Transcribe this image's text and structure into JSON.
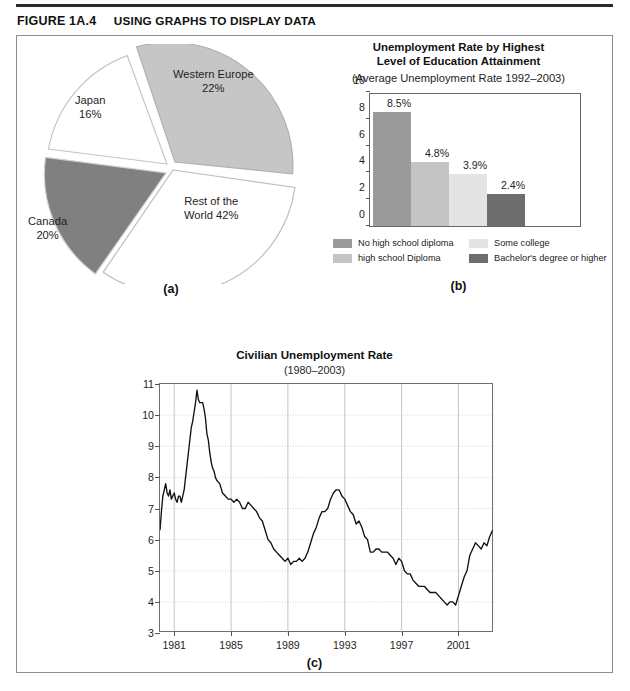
{
  "figure": {
    "number": "FIGURE 1A.4",
    "title": "USING GRAPHS TO DISPLAY DATA"
  },
  "panel_a": {
    "sublabel": "(a)",
    "labels": {
      "western_europe": "Western Europe\n22%",
      "japan": "Japan\n16%",
      "canada": "Canada\n20%",
      "rest": "Rest of the\nWorld 42%"
    },
    "chart_data": {
      "type": "pie",
      "title": "",
      "categories": [
        "Western Europe",
        "Rest of the World",
        "Canada",
        "Japan"
      ],
      "values": [
        22,
        42,
        20,
        16
      ],
      "units": "percent",
      "colors": [
        "#c6c6c6",
        "#ffffff",
        "#808080",
        "#ffffff"
      ],
      "exploded": true,
      "legend": "labels-outside"
    }
  },
  "panel_b": {
    "title": "Unemployment Rate by Highest\nLevel of Education Attainment",
    "subtitle": "(Average Unemployment Rate 1992–2003)",
    "sublabel": "(b)",
    "legend": [
      {
        "label": "No high school diploma",
        "color": "#9a9a9a"
      },
      {
        "label": "Some college",
        "color": "#e4e4e4"
      },
      {
        "label": "high school Diploma",
        "color": "#c4c4c4"
      },
      {
        "label": "Bachelor's degree or higher",
        "color": "#6e6e6e"
      }
    ],
    "chart_data": {
      "type": "bar",
      "title": "Unemployment Rate by Highest Level of Education Attainment",
      "subtitle": "(Average Unemployment Rate 1992–2003)",
      "xlabel": "",
      "ylabel": "",
      "ylim": [
        0,
        10
      ],
      "yticks": [
        0,
        2,
        4,
        6,
        8,
        10
      ],
      "grid": false,
      "categories": [
        "No high school diploma",
        "high school Diploma",
        "Some college",
        "Bachelor's degree or higher"
      ],
      "values": [
        8.5,
        4.8,
        3.9,
        2.4
      ],
      "value_labels": [
        "8.5%",
        "4.8%",
        "3.9%",
        "2.4%"
      ],
      "colors": [
        "#9a9a9a",
        "#c4c4c4",
        "#e4e4e4",
        "#6e6e6e"
      ]
    }
  },
  "panel_c": {
    "title": "Civilian Unemployment  Rate",
    "subtitle": "(1980–2003)",
    "sublabel": "(c)",
    "chart_data": {
      "type": "line",
      "title": "Civilian Unemployment Rate",
      "subtitle": "(1980–2003)",
      "xlabel": "",
      "ylabel": "",
      "xlim": [
        1980,
        2003.5
      ],
      "ylim": [
        3,
        11
      ],
      "yticks": [
        3,
        4,
        5,
        6,
        7,
        8,
        9,
        10,
        11
      ],
      "xticks": [
        1981,
        1985,
        1989,
        1993,
        1997,
        2001
      ],
      "grid": true,
      "line_color": "#111111",
      "x": [
        1980.0,
        1980.1,
        1980.2,
        1980.3,
        1980.4,
        1980.5,
        1980.6,
        1980.7,
        1980.8,
        1980.9,
        1981.0,
        1981.1,
        1981.2,
        1981.3,
        1981.4,
        1981.5,
        1981.6,
        1981.7,
        1981.8,
        1981.9,
        1982.0,
        1982.1,
        1982.2,
        1982.3,
        1982.4,
        1982.5,
        1982.6,
        1982.7,
        1982.8,
        1982.9,
        1983.0,
        1983.1,
        1983.2,
        1983.3,
        1983.4,
        1983.5,
        1983.6,
        1983.7,
        1983.8,
        1983.9,
        1984.0,
        1984.2,
        1984.4,
        1984.6,
        1984.8,
        1985.0,
        1985.2,
        1985.4,
        1985.6,
        1985.8,
        1986.0,
        1986.2,
        1986.4,
        1986.6,
        1986.8,
        1987.0,
        1987.2,
        1987.4,
        1987.6,
        1987.8,
        1988.0,
        1988.2,
        1988.4,
        1988.6,
        1988.8,
        1989.0,
        1989.2,
        1989.4,
        1989.6,
        1989.8,
        1990.0,
        1990.2,
        1990.4,
        1990.6,
        1990.8,
        1991.0,
        1991.2,
        1991.4,
        1991.6,
        1991.8,
        1992.0,
        1992.2,
        1992.4,
        1992.6,
        1992.8,
        1993.0,
        1993.2,
        1993.4,
        1993.6,
        1993.8,
        1994.0,
        1994.2,
        1994.4,
        1994.6,
        1994.8,
        1995.0,
        1995.2,
        1995.4,
        1995.6,
        1995.8,
        1996.0,
        1996.2,
        1996.4,
        1996.6,
        1996.8,
        1997.0,
        1997.2,
        1997.4,
        1997.6,
        1997.8,
        1998.0,
        1998.2,
        1998.4,
        1998.6,
        1998.8,
        1999.0,
        1999.2,
        1999.4,
        1999.6,
        1999.8,
        2000.0,
        2000.2,
        2000.4,
        2000.6,
        2000.8,
        2001.0,
        2001.2,
        2001.4,
        2001.6,
        2001.8,
        2002.0,
        2002.2,
        2002.4,
        2002.6,
        2002.8,
        2003.0,
        2003.2,
        2003.4
      ],
      "y": [
        6.3,
        6.9,
        7.4,
        7.6,
        7.8,
        7.5,
        7.4,
        7.6,
        7.3,
        7.4,
        7.5,
        7.3,
        7.2,
        7.4,
        7.4,
        7.2,
        7.4,
        7.6,
        8.0,
        8.4,
        8.8,
        9.2,
        9.6,
        9.8,
        10.1,
        10.4,
        10.8,
        10.5,
        10.4,
        10.4,
        10.4,
        10.2,
        9.9,
        9.4,
        9.2,
        8.8,
        8.5,
        8.3,
        8.2,
        8.0,
        7.9,
        7.8,
        7.5,
        7.4,
        7.3,
        7.3,
        7.2,
        7.3,
        7.2,
        7.0,
        7.0,
        7.2,
        7.1,
        7.0,
        6.9,
        6.7,
        6.6,
        6.3,
        6.0,
        5.9,
        5.7,
        5.6,
        5.5,
        5.4,
        5.3,
        5.4,
        5.2,
        5.3,
        5.3,
        5.4,
        5.3,
        5.4,
        5.6,
        5.9,
        6.2,
        6.4,
        6.7,
        6.9,
        6.9,
        7.0,
        7.3,
        7.5,
        7.6,
        7.6,
        7.4,
        7.3,
        7.1,
        6.9,
        6.8,
        6.5,
        6.6,
        6.4,
        6.1,
        6.0,
        5.6,
        5.6,
        5.7,
        5.7,
        5.6,
        5.6,
        5.6,
        5.5,
        5.4,
        5.2,
        5.4,
        5.3,
        5.0,
        4.9,
        4.9,
        4.7,
        4.6,
        4.5,
        4.5,
        4.5,
        4.4,
        4.3,
        4.3,
        4.3,
        4.2,
        4.1,
        4.0,
        3.9,
        4.0,
        4.0,
        3.9,
        4.2,
        4.5,
        4.8,
        5.0,
        5.5,
        5.7,
        5.9,
        5.8,
        5.7,
        5.9,
        5.8,
        6.1,
        6.3
      ]
    }
  }
}
